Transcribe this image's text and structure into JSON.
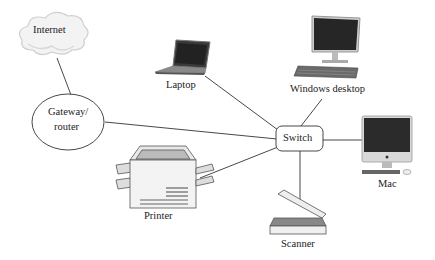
{
  "diagram": {
    "title": "",
    "nodes": [
      {
        "id": "internet",
        "label": "Internet",
        "icon": "cloud-icon"
      },
      {
        "id": "gateway",
        "label_line1": "Gateway/",
        "label_line2": "router",
        "shape": "ellipse"
      },
      {
        "id": "laptop",
        "label": "Laptop",
        "icon": "laptop-icon"
      },
      {
        "id": "windows",
        "label": "Windows desktop",
        "icon": "desktop-icon"
      },
      {
        "id": "switch",
        "label": "Switch",
        "shape": "rounded-rect"
      },
      {
        "id": "mac",
        "label": "Mac",
        "icon": "imac-icon"
      },
      {
        "id": "printer",
        "label": "Printer",
        "icon": "printer-icon"
      },
      {
        "id": "scanner",
        "label": "Scanner",
        "icon": "scanner-icon"
      }
    ],
    "edges": [
      [
        "internet",
        "gateway"
      ],
      [
        "gateway",
        "switch"
      ],
      [
        "laptop",
        "switch"
      ],
      [
        "windows",
        "switch"
      ],
      [
        "switch",
        "mac"
      ],
      [
        "switch",
        "printer"
      ],
      [
        "switch",
        "scanner"
      ]
    ],
    "colors": {
      "line": "#333333",
      "cloud": "#dcdcdc",
      "screen": "#2a2a2a"
    }
  }
}
